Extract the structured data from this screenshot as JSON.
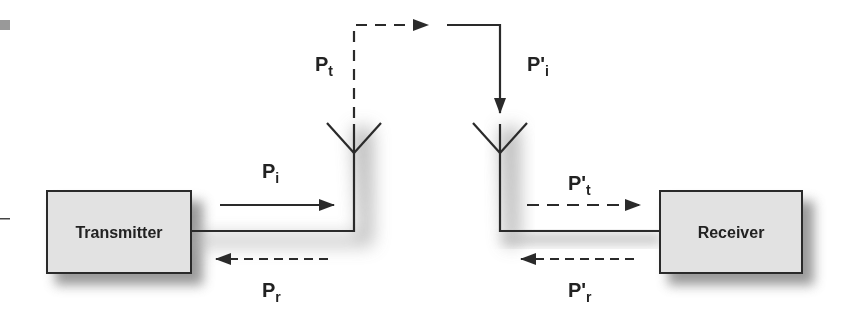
{
  "diagram": {
    "type": "radio-link-power-flow",
    "blocks": {
      "transmitter": {
        "label": "Transmitter"
      },
      "receiver": {
        "label": "Receiver"
      }
    },
    "labels": {
      "p_t": {
        "main": "P",
        "sub": "t"
      },
      "p_i": {
        "main": "P",
        "sub": "i"
      },
      "p_r": {
        "main": "P",
        "sub": "r"
      },
      "p_prime_i": {
        "main": "P'",
        "sub": "i"
      },
      "p_prime_t": {
        "main": "P'",
        "sub": "t"
      },
      "p_prime_r": {
        "main": "P'",
        "sub": "r"
      }
    },
    "arrows": [
      {
        "name": "incident-power-tx",
        "style": "solid",
        "direction": "right",
        "label": "Pi"
      },
      {
        "name": "reflected-power-tx",
        "style": "dashed",
        "direction": "left",
        "label": "Pr"
      },
      {
        "name": "transmitted-power",
        "style": "dashed",
        "direction": "up-right",
        "label": "Pt"
      },
      {
        "name": "incident-power-rx",
        "style": "solid",
        "direction": "down",
        "label": "P'i"
      },
      {
        "name": "transmitted-power-rx",
        "style": "dashed",
        "direction": "right",
        "label": "P't"
      },
      {
        "name": "reflected-power-rx",
        "style": "dashed",
        "direction": "left",
        "label": "P'r"
      }
    ],
    "colors": {
      "line": "#2a2a2a",
      "box_fill": "#e2e2e2",
      "box_border": "#2a2a2a",
      "shadow": "#8a8a8a"
    }
  }
}
